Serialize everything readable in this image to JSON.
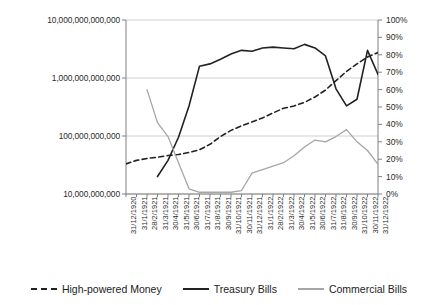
{
  "chart_data": {
    "type": "line",
    "title": "",
    "xlabel": "",
    "ylabel": "",
    "grid": true,
    "legend_position": "bottom",
    "x": [
      "31/12/1920",
      "31/1/1921",
      "28/2/1921",
      "31/3/1921",
      "30/4/1921",
      "31/5/1921",
      "30/6/1921",
      "31/7/1921",
      "31/8/1921",
      "30/9/1921",
      "31/10/1921",
      "30/11/1921",
      "31/12/1921",
      "31/1/1922",
      "28/2/1922",
      "31/3/1922",
      "30/4/1922",
      "31/5/1922",
      "30/6/1922",
      "31/7/1922",
      "31/8/1922",
      "30/9/1922",
      "31/10/1922",
      "30/11/1922",
      "31/12/1922"
    ],
    "axes": {
      "left": {
        "scale": "log",
        "ylim": [
          10000000000,
          10000000000000
        ],
        "ticks": [
          10000000000,
          100000000000,
          1000000000000,
          10000000000000
        ],
        "tick_labels": [
          "10,000,000,000",
          "100,000,000,000",
          "1,000,000,000,000",
          "10,000,000,000,000"
        ]
      },
      "right": {
        "scale": "linear",
        "ylim": [
          0,
          100
        ],
        "ticks": [
          0,
          10,
          20,
          30,
          40,
          50,
          60,
          70,
          80,
          90,
          100
        ],
        "tick_labels": [
          "0%",
          "10%",
          "20%",
          "30%",
          "40%",
          "50%",
          "60%",
          "70%",
          "80%",
          "90%",
          "100%"
        ]
      }
    },
    "series": [
      {
        "name": "High-powered Money",
        "style": "dashed",
        "color": "#222222",
        "axis": "left",
        "values": [
          33000000000,
          38000000000,
          41000000000,
          43000000000,
          46000000000,
          48000000000,
          52000000000,
          58000000000,
          72000000000,
          98000000000,
          125000000000,
          150000000000,
          175000000000,
          205000000000,
          250000000000,
          300000000000,
          330000000000,
          380000000000,
          470000000000,
          620000000000,
          900000000000,
          1300000000000,
          1750000000000,
          2300000000000,
          2750000000000
        ]
      },
      {
        "name": "Treasury Bills",
        "style": "solid",
        "color": "#222222",
        "axis": "left",
        "values": [
          null,
          null,
          null,
          20000000000,
          38000000000,
          95000000000,
          330000000000,
          1600000000000,
          1750000000000,
          2100000000000,
          2600000000000,
          3000000000000,
          2900000000000,
          3300000000000,
          3400000000000,
          3300000000000,
          3200000000000,
          3800000000000,
          3300000000000,
          2400000000000,
          650000000000,
          330000000000,
          430000000000,
          3000000000000,
          1150000000000
        ]
      },
      {
        "name": "Commercial Bills",
        "style": "solid",
        "color": "#a6a6a6",
        "axis": "right",
        "values": [
          null,
          null,
          60,
          41,
          33,
          18,
          3,
          1,
          1,
          1,
          1,
          2,
          12,
          14,
          16,
          18,
          22,
          27,
          31,
          30,
          33,
          37,
          30,
          25,
          17
        ]
      }
    ],
    "legend": [
      {
        "label": "High-powered Money",
        "style": "dashed",
        "color": "#222222"
      },
      {
        "label": "Treasury Bills",
        "style": "solid",
        "color": "#222222"
      },
      {
        "label": "Commercial Bills",
        "style": "solid",
        "color": "#a6a6a6"
      }
    ]
  }
}
